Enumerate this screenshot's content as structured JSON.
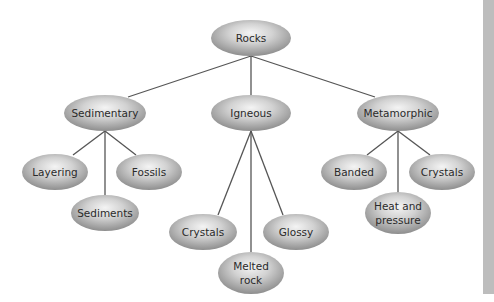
{
  "diagram": {
    "root": {
      "id": "rocks",
      "label": "Rocks"
    },
    "categories": [
      {
        "id": "sedimentary",
        "label": "Sedimentary",
        "children": [
          {
            "id": "layering",
            "label": "Layering"
          },
          {
            "id": "sediments",
            "label": "Sediments"
          },
          {
            "id": "fossils",
            "label": "Fossils"
          }
        ]
      },
      {
        "id": "igneous",
        "label": "Igneous",
        "children": [
          {
            "id": "crystals-igneous",
            "label": "Crystals"
          },
          {
            "id": "melted-rock",
            "label": [
              "Melted",
              "rock"
            ]
          },
          {
            "id": "glossy",
            "label": "Glossy"
          }
        ]
      },
      {
        "id": "metamorphic",
        "label": "Metamorphic",
        "children": [
          {
            "id": "banded",
            "label": "Banded"
          },
          {
            "id": "heat-and-pressure",
            "label": [
              "Heat and",
              "pressure"
            ]
          },
          {
            "id": "crystals-metamorphic",
            "label": "Crystals"
          }
        ]
      }
    ],
    "colors": {
      "node_highlight": "#f2f2f2",
      "node_mid": "#c8c8c8",
      "node_edge": "#8f8f8f",
      "line": "#555555",
      "text": "#2a2a2a",
      "side_strip": "#bdbdbd"
    }
  },
  "labels": {
    "rocks": "Rocks",
    "sedimentary": "Sedimentary",
    "igneous": "Igneous",
    "metamorphic": "Metamorphic",
    "layering": "Layering",
    "sediments": "Sediments",
    "fossils": "Fossils",
    "crystals_igneous": "Crystals",
    "melted_rock_1": "Melted",
    "melted_rock_2": "rock",
    "glossy": "Glossy",
    "banded": "Banded",
    "heat_pressure_1": "Heat and",
    "heat_pressure_2": "pressure",
    "crystals_metamorphic": "Crystals"
  }
}
